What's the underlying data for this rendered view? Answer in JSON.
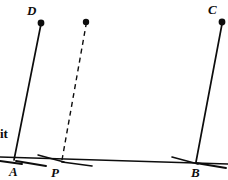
{
  "figure": {
    "width": 228,
    "height": 180,
    "background_color": "#ffffff",
    "ink_color": "#0d0d0d"
  },
  "text_fragment": {
    "label": "it",
    "x": 0,
    "y": 127
  },
  "labels": [
    {
      "name": "label-D",
      "text": "D",
      "x": 27,
      "y": 4
    },
    {
      "name": "label-C",
      "text": "C",
      "x": 208,
      "y": 3
    },
    {
      "name": "label-A",
      "text": "A",
      "x": 9,
      "y": 165
    },
    {
      "name": "label-P",
      "text": "P",
      "x": 51,
      "y": 166
    },
    {
      "name": "label-B",
      "text": "B",
      "x": 191,
      "y": 166
    }
  ],
  "points": [
    {
      "name": "point-D",
      "label": "D",
      "x": 41,
      "y": 23,
      "r": 3.4,
      "filled": true
    },
    {
      "name": "point-apex-unlabeled",
      "label": "",
      "x": 86,
      "y": 22,
      "r": 3.2,
      "filled": true
    },
    {
      "name": "point-C",
      "label": "C",
      "x": 222,
      "y": 22,
      "r": 3.4,
      "filled": true
    },
    {
      "name": "point-A",
      "label": "A",
      "x": 14,
      "y": 160,
      "r": 0,
      "filled": false
    },
    {
      "name": "point-P",
      "label": "P",
      "x": 62,
      "y": 160,
      "r": 0,
      "filled": false
    },
    {
      "name": "point-B",
      "label": "B",
      "x": 196,
      "y": 162,
      "r": 0,
      "filled": false
    }
  ],
  "baseline": {
    "name": "baseline-segment",
    "x1": 0,
    "y1": 157,
    "x2": 228,
    "y2": 164,
    "stroke_width": 1.6
  },
  "segments": [
    {
      "name": "segment-A-to-D",
      "from": "A",
      "to": "D",
      "x1": 14,
      "y1": 160,
      "x2": 41,
      "y2": 24,
      "style": "solid",
      "stroke_width": 1.7
    },
    {
      "name": "segment-P-to-apex",
      "from": "P",
      "to": "apex",
      "x1": 62,
      "y1": 160,
      "x2": 86,
      "y2": 25,
      "style": "dashed",
      "stroke_width": 1.4,
      "dash_pattern": "5 4"
    },
    {
      "name": "segment-B-to-C",
      "from": "B",
      "to": "C",
      "x1": 196,
      "y1": 162,
      "x2": 222,
      "y2": 24,
      "style": "solid",
      "stroke_width": 1.7
    }
  ],
  "angle_marks": [
    {
      "name": "angle-mark-A-left",
      "x1": 0,
      "y1": 161,
      "x2": 22,
      "y2": 164,
      "stroke_width": 1.9
    },
    {
      "name": "angle-mark-A-right",
      "x1": 16,
      "y1": 161,
      "x2": 46,
      "y2": 166,
      "stroke_width": 1.9
    },
    {
      "name": "angle-mark-P-left",
      "x1": 38,
      "y1": 155,
      "x2": 64,
      "y2": 162,
      "stroke_width": 1.5
    },
    {
      "name": "angle-mark-P-right",
      "x1": 62,
      "y1": 162,
      "x2": 92,
      "y2": 166,
      "stroke_width": 1.7
    },
    {
      "name": "angle-mark-B-left",
      "x1": 172,
      "y1": 157,
      "x2": 198,
      "y2": 164,
      "stroke_width": 1.6
    },
    {
      "name": "angle-mark-B-right",
      "x1": 196,
      "y1": 163,
      "x2": 226,
      "y2": 168,
      "stroke_width": 1.8
    }
  ]
}
